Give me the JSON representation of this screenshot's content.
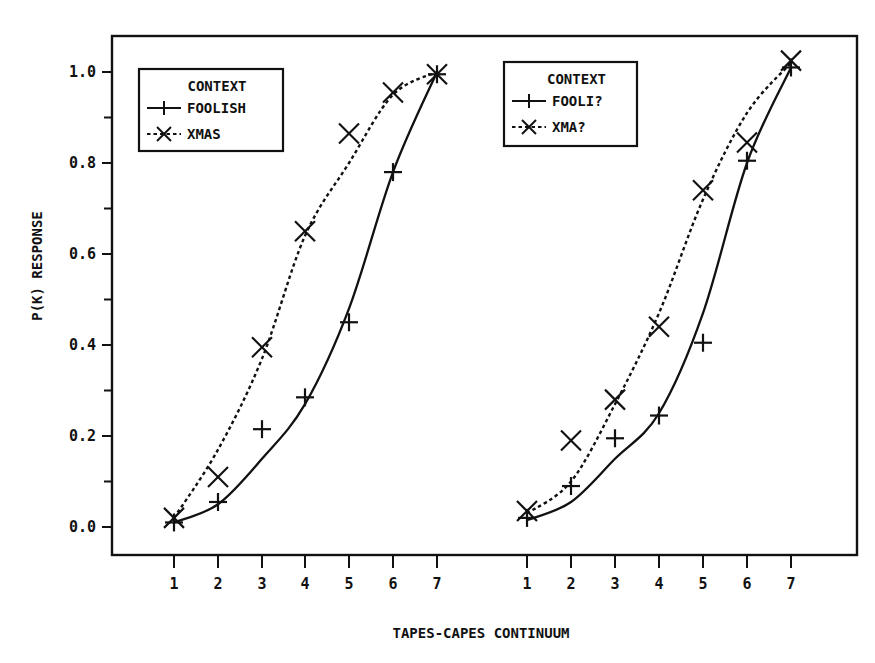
{
  "chart_data": {
    "type": "line",
    "title": "",
    "xlabel": "TAPES-CAPES CONTINUUM",
    "ylabel": "P(K) RESPONSE",
    "ylim": [
      0.0,
      1.0
    ],
    "yticks": [
      "0.0",
      "0.2",
      "0.4",
      "0.6",
      "0.8",
      "1.0"
    ],
    "grid": false,
    "panels": [
      {
        "name": "left",
        "categories": [
          1,
          2,
          3,
          4,
          5,
          6,
          7
        ],
        "xtick_labels": [
          "1",
          "2",
          "3",
          "4",
          "5",
          "6",
          "7"
        ],
        "legend": {
          "title": "CONTEXT",
          "position": "upper-left",
          "entries": [
            "FOOLISH",
            "XMAS"
          ]
        },
        "series": [
          {
            "name": "FOOLISH",
            "marker": "+",
            "line": "solid",
            "observed": [
              0.01,
              0.055,
              0.215,
              0.285,
              0.45,
              0.78,
              0.995
            ],
            "fitted": [
              0.01,
              0.05,
              0.15,
              0.27,
              0.48,
              0.78,
              1.0
            ]
          },
          {
            "name": "XMAS",
            "marker": "x",
            "line": "dotted",
            "observed": [
              0.02,
              0.11,
              0.395,
              0.65,
              0.865,
              0.955,
              0.995
            ],
            "fitted": [
              0.02,
              0.17,
              0.37,
              0.64,
              0.8,
              0.95,
              1.0
            ]
          }
        ]
      },
      {
        "name": "right",
        "categories": [
          1,
          2,
          3,
          4,
          5,
          6,
          7
        ],
        "xtick_labels": [
          "1",
          "2",
          "3",
          "4",
          "5",
          "6",
          "7"
        ],
        "legend": {
          "title": "CONTEXT",
          "position": "upper-center",
          "entries": [
            "FOOLI?",
            "XMA?"
          ]
        },
        "series": [
          {
            "name": "FOOLI?",
            "marker": "+",
            "line": "solid",
            "observed": [
              0.02,
              0.09,
              0.195,
              0.245,
              0.405,
              0.805,
              1.01
            ],
            "fitted": [
              0.015,
              0.055,
              0.15,
              0.25,
              0.47,
              0.8,
              1.01
            ]
          },
          {
            "name": "XMA?",
            "marker": "x",
            "line": "dotted",
            "observed": [
              0.035,
              0.19,
              0.28,
              0.44,
              0.74,
              0.845,
              1.025
            ],
            "fitted": [
              0.03,
              0.1,
              0.27,
              0.47,
              0.72,
              0.91,
              1.02
            ]
          }
        ]
      }
    ]
  },
  "layout": {
    "frame": {
      "left": 112,
      "top": 36,
      "right": 857,
      "bottom": 555
    },
    "y_axis": {
      "y0": 527,
      "y1": 72
    },
    "panel_x": {
      "left": [
        174,
        218,
        262,
        305,
        349,
        393,
        437
      ],
      "right": [
        527,
        571,
        615,
        659,
        703,
        747,
        791
      ]
    },
    "legend_boxes": {
      "left": [
        139,
        69,
        144,
        82
      ],
      "right": [
        504,
        62,
        133,
        84
      ]
    },
    "ink_color": "#111111"
  }
}
